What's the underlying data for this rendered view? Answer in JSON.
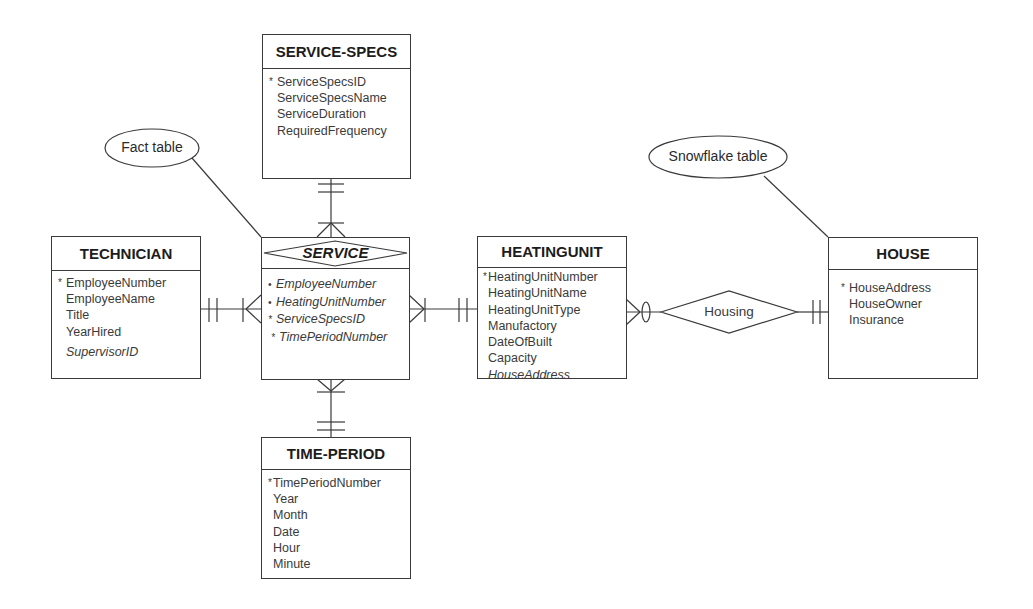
{
  "diagram": {
    "type": "entity-relationship (star/snowflake schema)",
    "callouts": {
      "fact_table": "Fact table",
      "snowflake_table": "Snowflake table"
    },
    "relationships": {
      "housing": "Housing"
    },
    "entities": {
      "service_specs": {
        "title": "SERVICE-SPECS",
        "attributes": [
          {
            "name": "ServiceSpecsID",
            "pk": "*"
          },
          {
            "name": "ServiceSpecsName",
            "pk": ""
          },
          {
            "name": "ServiceDuration",
            "pk": ""
          },
          {
            "name": "RequiredFrequency",
            "pk": ""
          }
        ]
      },
      "technician": {
        "title": "TECHNICIAN",
        "attributes": [
          {
            "name": "EmployeeNumber",
            "pk": "*"
          },
          {
            "name": "EmployeeName",
            "pk": ""
          },
          {
            "name": "Title",
            "pk": ""
          },
          {
            "name": "YearHired",
            "pk": ""
          },
          {
            "name": "SupervisorID",
            "pk": "",
            "fk": true
          }
        ]
      },
      "service": {
        "title": "SERVICE",
        "attributes": [
          {
            "name": "EmployeeNumber",
            "pk": "•",
            "fk": true
          },
          {
            "name": "HeatingUnitNumber",
            "pk": "•",
            "fk": true
          },
          {
            "name": "ServiceSpecsID",
            "pk": "*",
            "fk": true
          },
          {
            "name": "TimePeriodNumber",
            "pk": "*",
            "fk": true
          }
        ]
      },
      "heatingunit": {
        "title": "HEATINGUNIT",
        "attributes": [
          {
            "name": "HeatingUnitNumber",
            "pk": "*"
          },
          {
            "name": "HeatingUnitName",
            "pk": ""
          },
          {
            "name": "HeatingUnitType",
            "pk": ""
          },
          {
            "name": "Manufactory",
            "pk": ""
          },
          {
            "name": "DateOfBuilt",
            "pk": ""
          },
          {
            "name": "Capacity",
            "pk": ""
          },
          {
            "name": "HouseAddress",
            "pk": "",
            "fk": true
          }
        ]
      },
      "house": {
        "title": "HOUSE",
        "attributes": [
          {
            "name": "HouseAddress",
            "pk": "*"
          },
          {
            "name": "HouseOwner",
            "pk": ""
          },
          {
            "name": "Insurance",
            "pk": ""
          }
        ]
      },
      "time_period": {
        "title": "TIME-PERIOD",
        "attributes": [
          {
            "name": "TimePeriodNumber",
            "pk": "*"
          },
          {
            "name": "Year",
            "pk": ""
          },
          {
            "name": "Month",
            "pk": ""
          },
          {
            "name": "Date",
            "pk": ""
          },
          {
            "name": "Hour",
            "pk": ""
          },
          {
            "name": "Minute",
            "pk": ""
          }
        ]
      }
    },
    "connections": [
      {
        "from": "SERVICE-SPECS",
        "to": "SERVICE",
        "from_end": "one-and-only-one",
        "to_end": "one-or-many"
      },
      {
        "from": "TECHNICIAN",
        "to": "SERVICE",
        "from_end": "one-and-only-one",
        "to_end": "one-or-many"
      },
      {
        "from": "HEATINGUNIT",
        "to": "SERVICE",
        "from_end": "one-and-only-one",
        "to_end": "one-or-many"
      },
      {
        "from": "TIME-PERIOD",
        "to": "SERVICE",
        "from_end": "one-and-only-one",
        "to_end": "one-or-many"
      },
      {
        "from": "HOUSE",
        "to": "HEATINGUNIT",
        "via": "Housing",
        "from_end": "one-and-only-one",
        "to_end": "zero-or-many"
      }
    ]
  }
}
